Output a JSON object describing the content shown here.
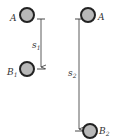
{
  "diagram": {
    "left": {
      "top_ball_label": "A",
      "bottom_ball_label": "B",
      "bottom_ball_subscript": "1",
      "distance_label": "s",
      "distance_subscript": "1"
    },
    "right": {
      "top_ball_label": "A",
      "bottom_ball_label": "B",
      "bottom_ball_subscript": "2",
      "distance_label": "s",
      "distance_subscript": "2"
    },
    "colors": {
      "ball_fill": "#b8b8b8",
      "ball_stroke": "#222222",
      "line": "#333333"
    }
  }
}
